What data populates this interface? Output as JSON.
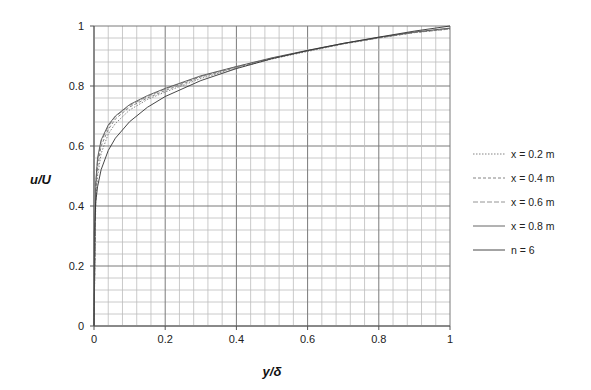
{
  "chart_data": {
    "type": "line",
    "title": "",
    "xlabel": "y/δ",
    "ylabel": "u/U",
    "xlim": [
      0,
      1
    ],
    "ylim": [
      0,
      1
    ],
    "xticks": [
      "0",
      "0.2",
      "0.4",
      "0.6",
      "0.8",
      "1"
    ],
    "yticks": [
      "0",
      "0.2",
      "0.4",
      "0.6",
      "0.8",
      "1"
    ],
    "grid": true,
    "minor_grid_step": 0.04,
    "legend_position": "right",
    "series": [
      {
        "name": "x = 0.2 m",
        "style": "dotted",
        "color": "#777777",
        "x": [
          0,
          0.005,
          0.01,
          0.02,
          0.04,
          0.06,
          0.1,
          0.15,
          0.2,
          0.3,
          0.4,
          0.5,
          0.6,
          0.7,
          0.8,
          0.9,
          1.0
        ],
        "y": [
          0,
          0.42,
          0.5,
          0.575,
          0.64,
          0.675,
          0.72,
          0.755,
          0.78,
          0.825,
          0.86,
          0.89,
          0.915,
          0.94,
          0.96,
          0.978,
          0.99
        ]
      },
      {
        "name": "x = 0.4 m",
        "style": "dashed",
        "color": "#777777",
        "x": [
          0,
          0.005,
          0.01,
          0.02,
          0.04,
          0.06,
          0.1,
          0.15,
          0.2,
          0.3,
          0.4,
          0.5,
          0.6,
          0.7,
          0.8,
          0.9,
          1.0
        ],
        "y": [
          0,
          0.45,
          0.53,
          0.6,
          0.655,
          0.69,
          0.73,
          0.76,
          0.785,
          0.83,
          0.862,
          0.892,
          0.917,
          0.94,
          0.96,
          0.978,
          0.99
        ]
      },
      {
        "name": "x = 0.6 m",
        "style": "dash",
        "color": "#888888",
        "x": [
          0,
          0.005,
          0.01,
          0.02,
          0.04,
          0.06,
          0.1,
          0.15,
          0.2,
          0.3,
          0.4,
          0.5,
          0.6,
          0.7,
          0.8,
          0.9,
          1.0
        ],
        "y": [
          0,
          0.47,
          0.55,
          0.615,
          0.665,
          0.698,
          0.735,
          0.765,
          0.79,
          0.832,
          0.864,
          0.893,
          0.918,
          0.941,
          0.961,
          0.979,
          0.992
        ]
      },
      {
        "name": "x = 0.8 m",
        "style": "solid",
        "color": "#555555",
        "x": [
          0,
          0.005,
          0.01,
          0.02,
          0.04,
          0.06,
          0.1,
          0.15,
          0.2,
          0.3,
          0.4,
          0.5,
          0.6,
          0.7,
          0.8,
          0.9,
          1.0
        ],
        "y": [
          0,
          0.48,
          0.56,
          0.62,
          0.67,
          0.7,
          0.738,
          0.768,
          0.792,
          0.834,
          0.865,
          0.894,
          0.919,
          0.942,
          0.962,
          0.98,
          0.993
        ]
      },
      {
        "name": "n = 6",
        "style": "solid",
        "color": "#333333",
        "formula": "u/U = (y/δ)^(1/6)",
        "x": [
          0,
          0.001,
          0.005,
          0.01,
          0.02,
          0.04,
          0.06,
          0.1,
          0.15,
          0.2,
          0.3,
          0.4,
          0.5,
          0.6,
          0.7,
          0.8,
          0.9,
          1.0
        ],
        "y": [
          0,
          0.316,
          0.414,
          0.464,
          0.521,
          0.585,
          0.626,
          0.681,
          0.729,
          0.765,
          0.818,
          0.858,
          0.891,
          0.918,
          0.942,
          0.963,
          0.983,
          1.0
        ]
      }
    ]
  }
}
